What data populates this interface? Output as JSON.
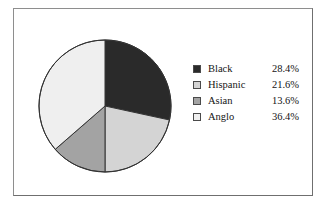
{
  "figure": {
    "background_color": "#ffffff",
    "border_color": "#8e8e8e"
  },
  "chart_data": {
    "type": "pie",
    "title": "",
    "subtitle": "",
    "xlabel": "",
    "ylabel": "",
    "legend_position": "right",
    "grid": false,
    "start_angle_deg": 0,
    "direction": "clockwise",
    "categories": [
      "Black",
      "Hispanic",
      "Asian",
      "Anglo"
    ],
    "values": [
      28.4,
      21.6,
      13.6,
      36.4
    ],
    "value_labels": [
      "28.4%",
      "21.6%",
      "13.6%",
      "36.4%"
    ],
    "units": "percent",
    "total": 100.0,
    "slice_colors": [
      "#2a2a2a",
      "#d4d4d4",
      "#a3a3a3",
      "#efefef"
    ],
    "slice_edge_color": "#333333",
    "slices": [
      {
        "label": "Black",
        "value": 28.4,
        "value_label": "28.4%",
        "color": "#2a2a2a",
        "start_deg": 0.0,
        "end_deg": 102.24
      },
      {
        "label": "Hispanic",
        "value": 21.6,
        "value_label": "21.6%",
        "color": "#d4d4d4",
        "start_deg": 102.24,
        "end_deg": 179.99
      },
      {
        "label": "Asian",
        "value": 13.6,
        "value_label": "13.6%",
        "color": "#a3a3a3",
        "start_deg": 179.99,
        "end_deg": 228.95
      },
      {
        "label": "Anglo",
        "value": 36.4,
        "value_label": "36.4%",
        "color": "#efefef",
        "start_deg": 228.95,
        "end_deg": 360.0
      }
    ]
  },
  "legend": {
    "rows": [
      {
        "label": "Black",
        "value": "28.4%",
        "color": "#2a2a2a"
      },
      {
        "label": "Hispanic",
        "value": "21.6%",
        "color": "#d4d4d4"
      },
      {
        "label": "Asian",
        "value": "13.6%",
        "color": "#a3a3a3"
      },
      {
        "label": "Anglo",
        "value": "36.4%",
        "color": "#efefef"
      }
    ]
  }
}
